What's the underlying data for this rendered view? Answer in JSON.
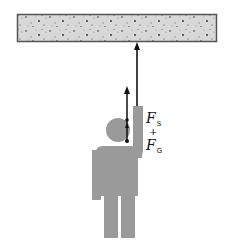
{
  "diagram": {
    "title": "",
    "colors": {
      "ceiling_fill": "#d6d6d6",
      "ceiling_border": "#555555",
      "figure": "#9a9a9a",
      "arrow": "#111111"
    },
    "ceiling": {
      "label": ""
    },
    "rope": {
      "label": ""
    },
    "force_labels": {
      "f1": "F",
      "f1_sub": "S",
      "plus": "+",
      "f2": "F",
      "f2_sub": "G"
    }
  }
}
